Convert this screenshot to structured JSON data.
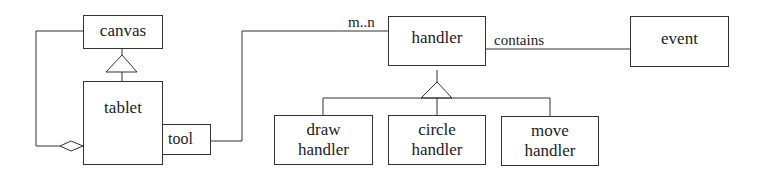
{
  "diagram": {
    "type": "UML class diagram",
    "classes": {
      "canvas": "canvas",
      "tablet": "tablet",
      "tool": "tool",
      "handler": "handler",
      "event": "event",
      "draw_handler": [
        "draw",
        "handler"
      ],
      "circle_handler": [
        "circle",
        "handler"
      ],
      "move_handler": [
        "move",
        "handler"
      ]
    },
    "labels": {
      "multiplicity": "m..n",
      "contains": "contains"
    },
    "relations": [
      {
        "from": "tablet",
        "to": "canvas",
        "kind": "generalization"
      },
      {
        "from": "tablet",
        "to": "canvas",
        "kind": "aggregation"
      },
      {
        "from": "tablet.tool",
        "to": "handler",
        "kind": "association",
        "label": "m..n"
      },
      {
        "from": "handler",
        "to": "event",
        "kind": "association",
        "label": "contains"
      },
      {
        "from": "draw handler",
        "to": "handler",
        "kind": "generalization"
      },
      {
        "from": "circle handler",
        "to": "handler",
        "kind": "generalization"
      },
      {
        "from": "move handler",
        "to": "handler",
        "kind": "generalization"
      }
    ]
  }
}
